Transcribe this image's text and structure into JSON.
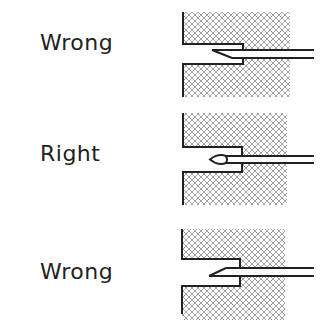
{
  "panels": [
    {
      "label": "Wrong",
      "needle": "bevel-down"
    },
    {
      "label": "Right",
      "needle": "eye-centered"
    },
    {
      "label": "Wrong",
      "needle": "bevel-up"
    }
  ],
  "colors": {
    "ink": "#222222",
    "hatch": "#8a8a8a",
    "background": "#ffffff"
  }
}
